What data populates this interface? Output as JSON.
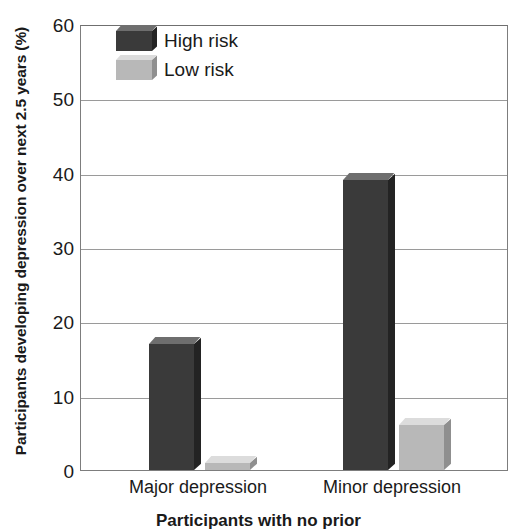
{
  "chart_data": {
    "type": "bar",
    "title": "",
    "categories": [
      "Major depression",
      "Minor depression"
    ],
    "series": [
      {
        "name": "High risk",
        "color": "#3a3a3a",
        "values": [
          17,
          39
        ]
      },
      {
        "name": "Low risk",
        "color": "#b8b8b8",
        "values": [
          1,
          6
        ]
      }
    ],
    "xlabel": "Participants with no prior",
    "ylabel": "Participants developing depression over next 2.5 years (%)",
    "ylim": [
      0,
      60
    ],
    "ytick_values": [
      0,
      10,
      20,
      30,
      40,
      50,
      60
    ],
    "ytick_labels": [
      "0",
      "10",
      "20",
      "30",
      "40",
      "50",
      "60"
    ],
    "grid": true,
    "legend_position": "top-left",
    "legend_entries": [
      "High risk",
      "Low risk"
    ]
  },
  "axes": {
    "y_title": "Participants developing depression over next 2.5 years (%)",
    "x_title": "Participants with no prior"
  },
  "legend": {
    "items": [
      {
        "label": "High risk",
        "swatch": "dark-gray-swatch"
      },
      {
        "label": "Low risk",
        "swatch": "light-gray-swatch"
      }
    ]
  }
}
